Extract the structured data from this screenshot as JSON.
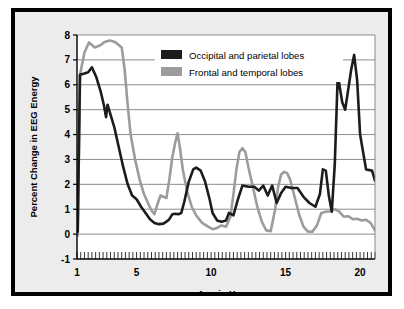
{
  "chart_data": {
    "type": "line",
    "title": "",
    "xlabel": "Age in Years",
    "ylabel": "Percent Change in EEG Energy",
    "xlim": [
      1,
      21
    ],
    "ylim": [
      -1,
      8
    ],
    "xticks": [
      1,
      5,
      10,
      15,
      20
    ],
    "xtick_labels": [
      "1",
      "5",
      "10",
      "15",
      "20"
    ],
    "yticks": [
      -1,
      0,
      1,
      2,
      3,
      4,
      5,
      6,
      7,
      8
    ],
    "ytick_labels": [
      "-1",
      "0",
      "1",
      "2",
      "3",
      "4",
      "5",
      "6",
      "7",
      "8"
    ],
    "minor_xtick_step": 0.25,
    "grid": "horizontal",
    "legend_position": "upper-center",
    "series": [
      {
        "name": "Occipital and parietal lobes",
        "color": "#1c1c1c",
        "x": [
          1.05,
          1.2,
          1.5,
          1.75,
          2.0,
          2.3,
          2.6,
          2.8,
          2.95,
          3.05,
          3.2,
          3.5,
          3.8,
          4.1,
          4.4,
          4.7,
          5.0,
          5.3,
          5.6,
          5.9,
          6.2,
          6.5,
          6.8,
          7.0,
          7.2,
          7.4,
          7.6,
          7.8,
          8.0,
          8.2,
          8.5,
          8.8,
          9.0,
          9.3,
          9.6,
          9.9,
          10.1,
          10.4,
          10.7,
          11.0,
          11.2,
          11.5,
          11.8,
          12.1,
          12.5,
          12.9,
          13.2,
          13.5,
          13.8,
          14.1,
          14.4,
          14.7,
          15.0,
          15.4,
          15.8,
          16.2,
          16.6,
          17.0,
          17.3,
          17.5,
          17.7,
          17.9,
          18.1,
          18.3,
          18.5,
          18.8,
          19.0,
          19.2,
          19.4,
          19.6,
          19.8,
          20.0,
          20.4,
          20.8,
          21.0
        ],
        "y": [
          0.1,
          6.4,
          6.45,
          6.5,
          6.7,
          6.3,
          5.7,
          5.2,
          4.7,
          5.2,
          4.9,
          4.3,
          3.5,
          2.7,
          2.0,
          1.55,
          1.4,
          1.1,
          0.85,
          0.6,
          0.45,
          0.4,
          0.42,
          0.5,
          0.6,
          0.8,
          0.82,
          0.8,
          0.85,
          1.3,
          2.1,
          2.6,
          2.67,
          2.55,
          2.1,
          1.4,
          0.85,
          0.55,
          0.5,
          0.55,
          0.85,
          0.75,
          1.4,
          1.95,
          1.9,
          1.9,
          1.75,
          1.95,
          1.55,
          1.95,
          1.25,
          1.65,
          1.9,
          1.85,
          1.85,
          1.5,
          1.25,
          1.1,
          1.6,
          2.6,
          2.55,
          1.55,
          0.9,
          2.8,
          6.4,
          5.3,
          5.0,
          5.8,
          6.6,
          7.2,
          6.2,
          4.0,
          2.6,
          2.55,
          2.15
        ]
      },
      {
        "name": "Frontal and temporal lobes",
        "color": "#9c9c9c",
        "x": [
          1.05,
          1.2,
          1.5,
          1.8,
          2.0,
          2.2,
          2.4,
          2.6,
          2.8,
          3.0,
          3.2,
          3.4,
          3.6,
          3.8,
          4.0,
          4.2,
          4.4,
          4.6,
          4.9,
          5.2,
          5.5,
          5.8,
          6.0,
          6.2,
          6.4,
          6.6,
          6.8,
          7.0,
          7.2,
          7.4,
          7.6,
          7.75,
          7.9,
          8.1,
          8.4,
          8.7,
          9.0,
          9.4,
          9.8,
          10.1,
          10.4,
          10.7,
          11.0,
          11.3,
          11.5,
          11.7,
          11.9,
          12.1,
          12.3,
          12.5,
          12.8,
          13.1,
          13.4,
          13.7,
          14.0,
          14.3,
          14.5,
          14.7,
          14.9,
          15.1,
          15.3,
          15.6,
          15.9,
          16.2,
          16.5,
          16.8,
          17.1,
          17.4,
          17.7,
          18.0,
          18.3,
          18.6,
          18.9,
          19.2,
          19.5,
          19.8,
          20.1,
          20.4,
          20.7,
          21.0
        ],
        "y": [
          -0.05,
          6.4,
          7.3,
          7.7,
          7.6,
          7.5,
          7.55,
          7.6,
          7.7,
          7.75,
          7.78,
          7.75,
          7.7,
          7.6,
          7.5,
          6.6,
          5.2,
          4.0,
          3.0,
          2.2,
          1.6,
          1.2,
          0.95,
          0.8,
          1.2,
          1.55,
          1.5,
          1.45,
          2.2,
          3.1,
          3.7,
          4.05,
          3.5,
          2.6,
          1.7,
          1.1,
          0.75,
          0.45,
          0.3,
          0.2,
          0.25,
          0.35,
          0.3,
          0.7,
          1.6,
          2.6,
          3.3,
          3.45,
          3.3,
          2.7,
          1.9,
          1.1,
          0.5,
          0.15,
          0.12,
          1.0,
          1.9,
          2.4,
          2.5,
          2.45,
          2.2,
          1.5,
          0.8,
          0.3,
          0.1,
          0.1,
          0.35,
          0.85,
          0.9,
          0.92,
          1.0,
          0.9,
          0.7,
          0.72,
          0.6,
          0.62,
          0.55,
          0.58,
          0.45,
          0.15
        ]
      }
    ],
    "legend": [
      {
        "label": "Occipital and parietal lobes",
        "color": "#1c1c1c"
      },
      {
        "label": "Frontal and temporal lobes",
        "color": "#9c9c9c"
      }
    ]
  }
}
